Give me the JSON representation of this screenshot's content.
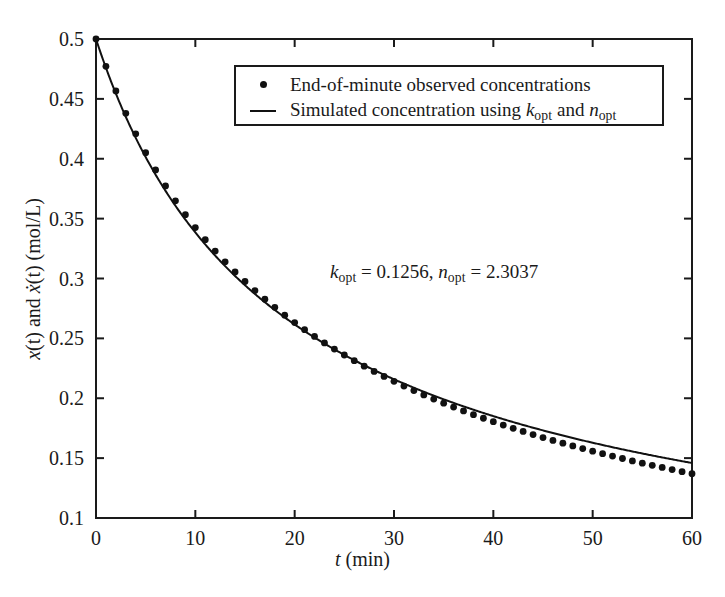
{
  "chart_data": {
    "type": "line",
    "title": "",
    "xlabel_plain": "t (min)",
    "ylabel_plain": "x(t) and xdot(t) (mol/L)",
    "xlim": [
      0,
      60
    ],
    "ylim": [
      0.1,
      0.5
    ],
    "xticks": [
      0,
      10,
      20,
      30,
      40,
      50,
      60
    ],
    "yticks": [
      0.1,
      0.15,
      0.2,
      0.25,
      0.3,
      0.35,
      0.4,
      0.45,
      0.5
    ],
    "ytick_labels": [
      "0.1",
      "0.15",
      "0.2",
      "0.25",
      "0.3",
      "0.35",
      "0.4",
      "0.45",
      "0.5"
    ],
    "xtick_labels": [
      "0",
      "10",
      "20",
      "30",
      "40",
      "50",
      "60"
    ],
    "grid": false,
    "legend_position": "upper center",
    "model": {
      "equation": "dx/dt = -k x^n",
      "k_opt": 0.1256,
      "n_opt": 2.3037,
      "x0": 0.5
    },
    "series": [
      {
        "name": "End-of-minute observed concentrations",
        "marker": "dot",
        "line": "none",
        "color": "#111111",
        "x": [
          0,
          1,
          2,
          3,
          4,
          5,
          6,
          7,
          8,
          9,
          10,
          11,
          12,
          13,
          14,
          15,
          16,
          17,
          18,
          19,
          20,
          21,
          22,
          23,
          24,
          25,
          26,
          27,
          28,
          29,
          30,
          31,
          32,
          33,
          34,
          35,
          36,
          37,
          38,
          39,
          40,
          41,
          42,
          43,
          44,
          45,
          46,
          47,
          48,
          49,
          50,
          51,
          52,
          53,
          54,
          55,
          56,
          57,
          58,
          59,
          60
        ],
        "values": [
          0.5,
          0.4772,
          0.4566,
          0.4379,
          0.4208,
          0.4051,
          0.3907,
          0.3773,
          0.3649,
          0.3533,
          0.3425,
          0.3324,
          0.3229,
          0.3139,
          0.3055,
          0.2975,
          0.2899,
          0.2827,
          0.2759,
          0.2694,
          0.2632,
          0.2573,
          0.2516,
          0.2462,
          0.2411,
          0.2361,
          0.2314,
          0.2268,
          0.2224,
          0.2182,
          0.2141,
          0.2102,
          0.2064,
          0.2028,
          0.1993,
          0.1959,
          0.1926,
          0.1894,
          0.1863,
          0.1833,
          0.1804,
          0.1776,
          0.1749,
          0.1723,
          0.1697,
          0.1672,
          0.1648,
          0.1625,
          0.1602,
          0.158,
          0.1558,
          0.1537,
          0.1517,
          0.1497,
          0.1477,
          0.1458,
          0.144,
          0.1422,
          0.1404,
          0.1387,
          0.137
        ]
      },
      {
        "name": "Simulated concentration using k_opt and n_opt",
        "marker": "none",
        "line": "solid",
        "color": "#111111"
      }
    ]
  },
  "axes": {
    "x_title": {
      "var": "t",
      "unit": "(min)"
    },
    "y_title": {
      "part1_var": "x",
      "part1_arg": "(t)",
      "conjunction": " and ",
      "part2_var": "x",
      "part2_accent": "̇",
      "part2_arg": "(t)",
      "unit": " (mol/L)"
    }
  },
  "legend": {
    "entries": [
      {
        "key": "dot",
        "text": "End-of-minute observed concentrations"
      },
      {
        "key": "line",
        "text_pre": "Simulated concentration using ",
        "sym1": "k",
        "sub1": "opt",
        "text_mid": " and ",
        "sym2": "n",
        "sub2": "opt"
      }
    ]
  },
  "annotation": {
    "sym1": "k",
    "sub1": "opt",
    "eq1": " = 0.1256, ",
    "sym2": "n",
    "sub2": "opt",
    "eq2": " = 2.3037"
  },
  "colors": {
    "axis": "#1a1a1a",
    "data": "#111111",
    "background": "#ffffff"
  }
}
